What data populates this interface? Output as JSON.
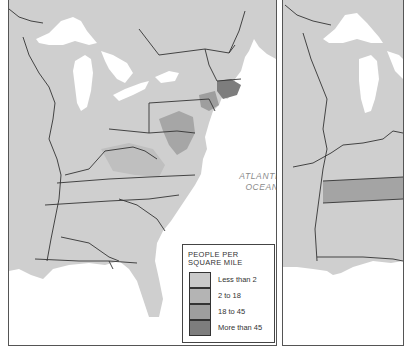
{
  "maps": [
    {
      "id": "left",
      "ocean_label_line1": "ATLANTIC",
      "ocean_label_line2": "OCEAN",
      "legend": {
        "title_line1": "PEOPLE PER",
        "title_line2": "SQUARE MILE",
        "items": [
          {
            "label": "Less than 2",
            "color": "#c9c9c9"
          },
          {
            "label": "2 to 18",
            "color": "#b4b4b4"
          },
          {
            "label": "18 to 45",
            "color": "#9e9e9e"
          },
          {
            "label": "More than 45",
            "color": "#7d7d7d"
          }
        ]
      }
    },
    {
      "id": "right"
    }
  ],
  "colors": {
    "land": "#cfcfcf",
    "water": "#ffffff",
    "border": "#333333",
    "frame": "#555555"
  }
}
